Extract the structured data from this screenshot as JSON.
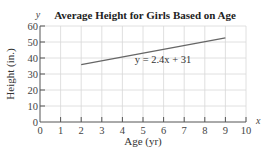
{
  "chart_data": {
    "type": "line",
    "title": "Average Height for Girls Based on Age",
    "xlabel": "Age (yr)",
    "ylabel": "Height (in.)",
    "x_axis_var": "x",
    "y_axis_var": "y",
    "xlim": [
      0,
      10
    ],
    "ylim": [
      0,
      60
    ],
    "x_ticks": [
      0,
      1,
      2,
      3,
      4,
      5,
      6,
      7,
      8,
      9,
      10
    ],
    "y_ticks": [
      0,
      10,
      20,
      30,
      40,
      50,
      60
    ],
    "grid": true,
    "series": [
      {
        "name": "y = 2.4x + 31",
        "x": [
          2,
          9
        ],
        "y": [
          35.8,
          52.6
        ],
        "color": "#666666"
      }
    ],
    "annotations": [
      {
        "text": "y = 2.4x + 31",
        "x": 6,
        "y": 40
      }
    ],
    "legend": null
  },
  "labels": {
    "title": "Average Height for Girls Based on Age",
    "xlabel": "Age (yr)",
    "ylabel": "Height (in.)",
    "x_var": "x",
    "y_var": "y",
    "equation": "y = 2.4x + 31",
    "x_ticks": [
      "0",
      "1",
      "2",
      "3",
      "4",
      "5",
      "6",
      "7",
      "8",
      "9",
      "10"
    ],
    "y_ticks": [
      "0",
      "10",
      "20",
      "30",
      "40",
      "50",
      "60"
    ]
  }
}
